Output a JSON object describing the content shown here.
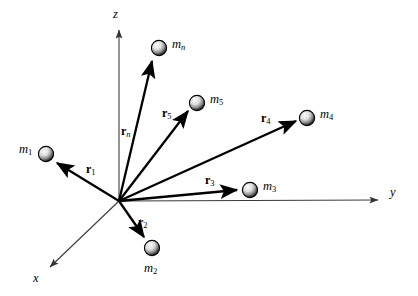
{
  "figure": {
    "background_color": "#ffffff",
    "ink_color": "#000000",
    "width": 418,
    "height": 296
  },
  "axes": [
    {
      "name": "z-axis",
      "label": "z",
      "label_x": 113,
      "label_y": 8,
      "style": "thin",
      "from": [
        119,
        201
      ],
      "to": [
        119,
        28
      ]
    },
    {
      "name": "y-axis",
      "label": "y",
      "label_x": 390,
      "label_y": 186,
      "style": "thin",
      "from": [
        119,
        201
      ],
      "to": [
        382,
        200
      ]
    },
    {
      "name": "x-axis",
      "label": "x",
      "label_x": 33,
      "label_y": 272,
      "style": "thin",
      "from": [
        119,
        201
      ],
      "to": [
        47,
        269
      ]
    }
  ],
  "origin": {
    "x": 119,
    "y": 201,
    "label": ""
  },
  "vectors": [
    {
      "name": "r1",
      "symbol": "r",
      "subscript": "1",
      "label_x": 86,
      "label_y": 163,
      "from": [
        119,
        201
      ],
      "to": [
        55,
        162
      ]
    },
    {
      "name": "r2",
      "symbol": "r",
      "subscript": "2",
      "label_x": 138,
      "label_y": 216,
      "from": [
        119,
        201
      ],
      "to": [
        145,
        239
      ]
    },
    {
      "name": "r3",
      "symbol": "r",
      "subscript": "3",
      "label_x": 205,
      "label_y": 174,
      "from": [
        119,
        201
      ],
      "to": [
        239,
        190
      ]
    },
    {
      "name": "r4",
      "symbol": "r",
      "subscript": "4",
      "label_x": 261,
      "label_y": 112,
      "from": [
        119,
        201
      ],
      "to": [
        298,
        120
      ]
    },
    {
      "name": "r5",
      "symbol": "r",
      "subscript": "5",
      "label_x": 162,
      "label_y": 107,
      "from": [
        119,
        201
      ],
      "to": [
        189,
        109
      ]
    },
    {
      "name": "rn",
      "symbol": "r",
      "subscript": "n",
      "label_x": 121,
      "label_y": 125,
      "from": [
        119,
        201
      ],
      "to": [
        153,
        58
      ]
    }
  ],
  "masses": [
    {
      "name": "m1",
      "symbol": "m",
      "subscript": "1",
      "cx": 46,
      "cy": 154,
      "r": 7.5,
      "label_x": 19,
      "label_y": 143
    },
    {
      "name": "m2",
      "symbol": "m",
      "subscript": "2",
      "cx": 152,
      "cy": 248,
      "r": 7.5,
      "label_x": 144,
      "label_y": 262
    },
    {
      "name": "m3",
      "symbol": "m",
      "subscript": "3",
      "cx": 250,
      "cy": 190,
      "r": 7.5,
      "label_x": 263,
      "label_y": 180
    },
    {
      "name": "m4",
      "symbol": "m",
      "subscript": "4",
      "cx": 307,
      "cy": 118,
      "r": 7.5,
      "label_x": 320,
      "label_y": 108
    },
    {
      "name": "m5",
      "symbol": "m",
      "subscript": "5",
      "cx": 197,
      "cy": 103,
      "r": 7.5,
      "label_x": 210,
      "label_y": 93
    },
    {
      "name": "mn",
      "symbol": "m",
      "subscript": "n",
      "cx": 159,
      "cy": 48,
      "r": 7.5,
      "label_x": 172,
      "label_y": 38
    }
  ]
}
